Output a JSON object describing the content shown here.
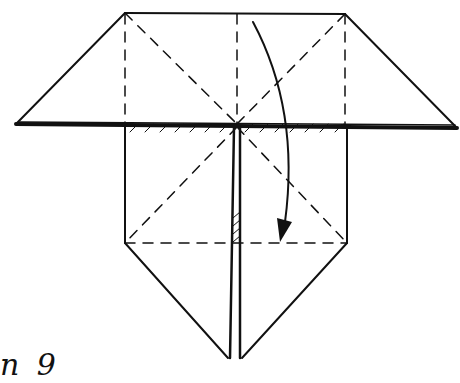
{
  "diagram": {
    "type": "origami-fold-step",
    "step_label": "n 9",
    "colors": {
      "ink": "#111111",
      "paper": "#ffffff"
    },
    "elements": {
      "top_edge": "solid",
      "trapezoid_sides": "solid",
      "horizontal_fold_edge": "thick hatched",
      "valley_folds": "dashed",
      "center_slit": "double solid line",
      "fold_arrow": "curved arrow pointing down"
    }
  }
}
